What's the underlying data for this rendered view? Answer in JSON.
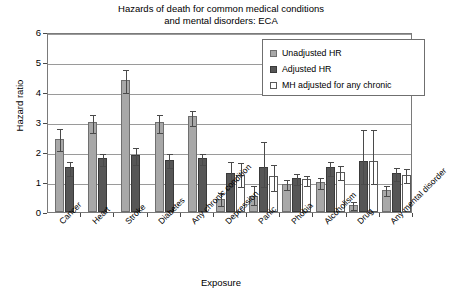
{
  "chart_data": {
    "type": "bar",
    "title": "Hazards of death for common medical conditions and mental disorders: ECA",
    "title_line1": "Hazards of death for common medical conditions",
    "title_line2": "and mental disorders: ECA",
    "xlabel": "Exposure",
    "ylabel": "Hazard ratio",
    "ylim": [
      0,
      6
    ],
    "yticks": [
      0,
      1,
      2,
      3,
      4,
      5,
      6
    ],
    "ytick_labels": [
      "0",
      "1",
      "2",
      "3",
      "4",
      "5",
      "6"
    ],
    "grid": true,
    "legend_position": "top-right",
    "categories": [
      "Cancer",
      "Heart",
      "Stroke",
      "Diabetes",
      "Any chronic condition",
      "Depression",
      "Panic",
      "Phobia",
      "Alcoholism",
      "Drug",
      "Any mental disorder"
    ],
    "series": [
      {
        "name": "Unadjusted HR",
        "color": "#a8a8a8",
        "values": [
          2.45,
          3.0,
          4.4,
          3.0,
          3.2,
          0.45,
          0.55,
          0.95,
          1.0,
          0.25,
          0.75
        ],
        "err_upper": [
          2.85,
          3.3,
          4.8,
          3.3,
          3.45,
          0.7,
          0.95,
          1.15,
          1.2,
          0.4,
          0.95
        ],
        "err_lower": [
          2.1,
          2.7,
          4.05,
          2.7,
          2.95,
          0.28,
          0.3,
          0.8,
          0.85,
          0.14,
          0.6
        ]
      },
      {
        "name": "Adjusted HR",
        "color": "#565656",
        "values": [
          1.5,
          1.8,
          1.9,
          1.75,
          1.8,
          1.3,
          1.5,
          1.15,
          1.5,
          1.7,
          1.3
        ],
        "err_upper": [
          1.75,
          2.0,
          2.2,
          2.0,
          2.0,
          1.75,
          2.4,
          1.35,
          1.75,
          2.8,
          1.55
        ],
        "err_lower": [
          1.28,
          1.6,
          1.62,
          1.52,
          1.62,
          0.95,
          0.9,
          0.98,
          1.28,
          1.0,
          1.1
        ]
      },
      {
        "name": "MH adjusted for any chronic",
        "color": "#ffffff",
        "values": [
          null,
          null,
          null,
          null,
          null,
          1.25,
          1.2,
          1.1,
          1.35,
          1.7,
          1.25
        ],
        "err_upper": [
          null,
          null,
          null,
          null,
          null,
          1.7,
          1.65,
          1.28,
          1.6,
          2.8,
          1.5
        ],
        "err_lower": [
          null,
          null,
          null,
          null,
          null,
          0.9,
          0.78,
          0.94,
          1.12,
          1.0,
          1.05
        ]
      }
    ]
  },
  "legend": {
    "items": [
      {
        "label": "Unadjusted HR"
      },
      {
        "label": "Adjusted HR"
      },
      {
        "label": "MH adjusted for any chronic"
      }
    ]
  }
}
